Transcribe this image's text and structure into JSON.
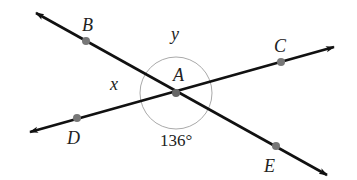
{
  "diagram": {
    "type": "intersecting-lines-angles",
    "colors": {
      "line": "#111111",
      "point": "#777777",
      "circle": "#aaaaaa",
      "text": "#222222"
    },
    "center": {
      "name": "A",
      "label": "A",
      "x": 176,
      "y": 93
    },
    "points": {
      "B": {
        "label": "B",
        "x": 86,
        "y": 41
      },
      "C": {
        "label": "C",
        "x": 281,
        "y": 62
      },
      "D": {
        "label": "D",
        "x": 77,
        "y": 118
      },
      "E": {
        "label": "E",
        "x": 276,
        "y": 146
      }
    },
    "lines": [
      {
        "name": "line-BE",
        "through": [
          "B",
          "A",
          "E"
        ]
      },
      {
        "name": "line-DC",
        "through": [
          "D",
          "A",
          "C"
        ]
      }
    ],
    "angles": {
      "x": {
        "label": "x",
        "between": [
          "B",
          "D"
        ]
      },
      "y": {
        "label": "y",
        "between": [
          "B",
          "C"
        ]
      },
      "given": {
        "label": "136°",
        "value": 136,
        "between": [
          "D",
          "E"
        ]
      }
    }
  }
}
